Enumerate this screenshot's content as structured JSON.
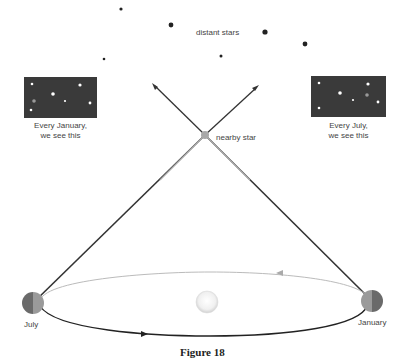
{
  "labels": {
    "distant_stars": "distant stars",
    "nearby_star": "nearby star",
    "january_view_line1": "Every January,",
    "january_view_line2": "we see this",
    "july_view_line1": "Every July,",
    "july_view_line2": "we see this",
    "earth_left": "July",
    "earth_right": "January",
    "caption": "Figure 18"
  },
  "colors": {
    "star_dark": "#222222",
    "sky_box": "#3a3a3a",
    "nearby_star": "#a8a8a8",
    "orbit_top": "#bbbbbb",
    "orbit_bottom": "#222222",
    "sight_line_dark": "#333333",
    "sight_line_light": "#aaaaaa",
    "sun": "#eeeeee"
  },
  "distant_stars": [
    {
      "x": 121,
      "y": 9,
      "r": 1.6
    },
    {
      "x": 171,
      "y": 25,
      "r": 2.4
    },
    {
      "x": 265,
      "y": 32,
      "r": 2.6
    },
    {
      "x": 305,
      "y": 44,
      "r": 2.4
    },
    {
      "x": 221,
      "y": 56,
      "r": 1.5
    },
    {
      "x": 104,
      "y": 59,
      "r": 1.3
    }
  ]
}
